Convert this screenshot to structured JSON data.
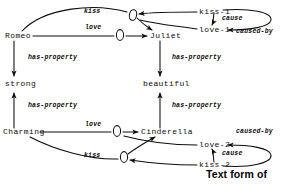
{
  "diagram": {
    "type": "semantic-network",
    "caption": "Text form of",
    "entity_nodes": [
      {
        "id": "romeo",
        "label": "Romeo",
        "x": 5,
        "y": 36
      },
      {
        "id": "juliet",
        "label": "Juliet",
        "x": 150,
        "y": 36
      },
      {
        "id": "strong",
        "label": "strong",
        "x": 5,
        "y": 83
      },
      {
        "id": "beautiful",
        "label": "beautiful",
        "x": 143,
        "y": 83
      },
      {
        "id": "charming",
        "label": "Charming",
        "x": 3,
        "y": 132
      },
      {
        "id": "cinderella",
        "label": "Cinderella",
        "x": 141,
        "y": 132
      },
      {
        "id": "kiss-1",
        "label": "kiss-1",
        "x": 199,
        "y": 9
      },
      {
        "id": "love-1",
        "label": "love-1",
        "x": 199,
        "y": 31
      },
      {
        "id": "love-2",
        "label": "love-2",
        "x": 199,
        "y": 142
      },
      {
        "id": "kiss-2",
        "label": "kiss-2",
        "x": 199,
        "y": 163
      }
    ],
    "edge_labels": [
      {
        "id": "kiss-top",
        "label": "kiss",
        "x": 84,
        "y": 11
      },
      {
        "id": "love-top",
        "label": "love",
        "x": 85,
        "y": 27
      },
      {
        "id": "cause-top",
        "label": "cause",
        "x": 223,
        "y": 18
      },
      {
        "id": "caused-by-top",
        "label": "caused-by",
        "x": 238,
        "y": 31
      },
      {
        "id": "has-property-tl",
        "label": "has-property",
        "x": 28,
        "y": 57
      },
      {
        "id": "has-property-tr",
        "label": "has-property",
        "x": 172,
        "y": 57
      },
      {
        "id": "has-property-bl",
        "label": "has-property",
        "x": 28,
        "y": 105
      },
      {
        "id": "has-property-br",
        "label": "has-property",
        "x": 172,
        "y": 105
      },
      {
        "id": "love-bottom",
        "label": "love",
        "x": 85,
        "y": 124
      },
      {
        "id": "kiss-bottom",
        "label": "kiss",
        "x": 84,
        "y": 155
      },
      {
        "id": "cause-bottom",
        "label": "cause",
        "x": 223,
        "y": 152
      },
      {
        "id": "caused-by-bottom",
        "label": "caused-by",
        "x": 238,
        "y": 131
      }
    ],
    "relation_nodes": [
      {
        "id": "rel-kiss-top",
        "cx": 133,
        "cy": 15
      },
      {
        "id": "rel-love-top",
        "cx": 120,
        "cy": 35
      },
      {
        "id": "rel-love-bottom",
        "cx": 117,
        "cy": 131
      },
      {
        "id": "rel-kiss-bottom",
        "cx": 124,
        "cy": 157
      }
    ],
    "colors": {
      "ink": "#0d0d0d",
      "background": "#ffffff"
    }
  }
}
